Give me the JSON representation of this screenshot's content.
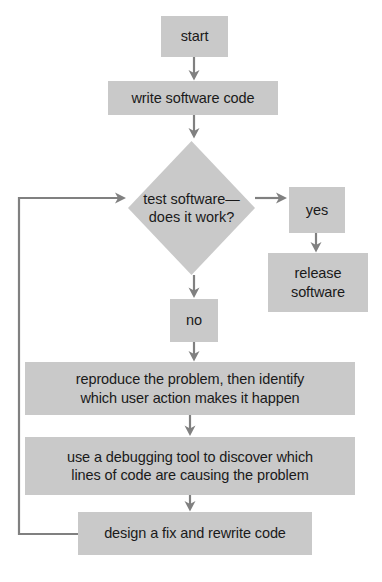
{
  "diagram": {
    "colors": {
      "node_fill": "#c9c9c9",
      "node_fill_light": "#d0d0d0",
      "text": "#1a1a1a",
      "connector": "#808080",
      "background": "#ffffff"
    },
    "nodes": [
      {
        "id": "start",
        "shape": "rect",
        "label": "start",
        "x": 161,
        "y": 16,
        "w": 67,
        "h": 41
      },
      {
        "id": "write-software-code",
        "shape": "rect",
        "label": "write software code",
        "x": 108,
        "y": 81,
        "w": 170,
        "h": 34
      },
      {
        "id": "test-software",
        "shape": "diamond",
        "label": "test software—\ndoes it work?",
        "x": 128,
        "y": 141,
        "w": 127,
        "h": 134
      },
      {
        "id": "yes",
        "shape": "rect",
        "label": "yes",
        "x": 289,
        "y": 187,
        "w": 56,
        "h": 46
      },
      {
        "id": "release-software",
        "shape": "rect",
        "label": "release\nsoftware",
        "x": 268,
        "y": 253,
        "w": 100,
        "h": 59
      },
      {
        "id": "no",
        "shape": "rect",
        "label": "no",
        "x": 170,
        "y": 299,
        "w": 48,
        "h": 43
      },
      {
        "id": "reproduce-problem",
        "shape": "rect",
        "label": "reproduce the problem, then identify\nwhich user action makes it happen",
        "x": 25,
        "y": 362,
        "w": 330,
        "h": 53
      },
      {
        "id": "use-debugging-tool",
        "shape": "rect",
        "label": "use a debugging tool to discover which\nlines of code are causing the problem",
        "x": 25,
        "y": 437,
        "w": 330,
        "h": 58
      },
      {
        "id": "design-fix",
        "shape": "rect",
        "label": "design a fix and rewrite code",
        "x": 78,
        "y": 512,
        "w": 234,
        "h": 43
      }
    ],
    "connectors": [
      {
        "id": "start-to-write",
        "from": "start",
        "to": "write-software-code",
        "kind": "arrow-down"
      },
      {
        "id": "write-to-test",
        "from": "write-software-code",
        "to": "test-software",
        "kind": "arrow-down"
      },
      {
        "id": "test-to-yes",
        "from": "test-software",
        "to": "yes",
        "kind": "arrow-right"
      },
      {
        "id": "yes-to-release",
        "from": "yes",
        "to": "release-software",
        "kind": "arrow-down"
      },
      {
        "id": "test-to-no",
        "from": "test-software",
        "to": "no",
        "kind": "arrow-down"
      },
      {
        "id": "no-to-reproduce",
        "from": "no",
        "to": "reproduce-problem",
        "kind": "arrow-down"
      },
      {
        "id": "reproduce-to-debug",
        "from": "reproduce-problem",
        "to": "use-debugging-tool",
        "kind": "arrow-down"
      },
      {
        "id": "debug-to-design",
        "from": "use-debugging-tool",
        "to": "design-fix",
        "kind": "arrow-down"
      },
      {
        "id": "design-to-test-loop",
        "from": "design-fix",
        "to": "test-software",
        "kind": "feedback-loop-left"
      }
    ]
  }
}
